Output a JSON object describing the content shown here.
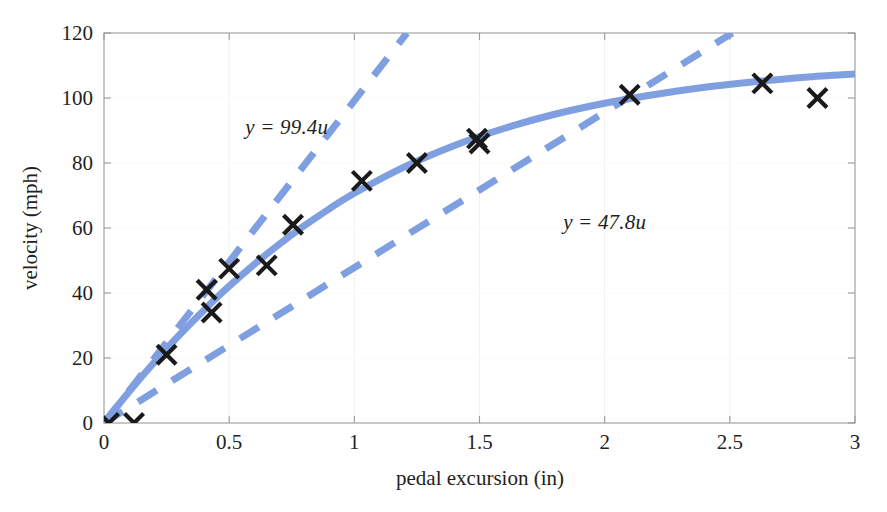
{
  "chart_data": {
    "type": "scatter",
    "title": "",
    "xlabel": "pedal excursion (in)",
    "ylabel": "velocity (mph)",
    "xlim": [
      0,
      3
    ],
    "ylim": [
      0,
      120
    ],
    "xticks": [
      "0",
      "0.5",
      "1",
      "1.5",
      "2",
      "2.5",
      "3"
    ],
    "xtick_values": [
      0,
      0.5,
      1,
      1.5,
      2,
      2.5,
      3
    ],
    "yticks": [
      "0",
      "20",
      "40",
      "60",
      "80",
      "100",
      "120"
    ],
    "ytick_values": [
      0,
      20,
      40,
      60,
      80,
      100,
      120
    ],
    "grid": "faint-vertical",
    "legend": "none",
    "marker": "x-cross-black",
    "accent_color": "#7f9fe0",
    "marker_color": "#1a1a1a",
    "axis_color": "#9a9a9a",
    "text_color": "#231f20",
    "series": [
      {
        "name": "measured data",
        "type": "scatter",
        "points": [
          [
            0.02,
            0.0
          ],
          [
            0.12,
            0.0
          ],
          [
            0.25,
            21.0
          ],
          [
            0.41,
            41.0
          ],
          [
            0.43,
            34.0
          ],
          [
            0.5,
            47.5
          ],
          [
            0.65,
            48.5
          ],
          [
            0.755,
            61.0
          ],
          [
            1.03,
            74.5
          ],
          [
            1.25,
            80.0
          ],
          [
            1.49,
            87.5
          ],
          [
            1.5,
            86.0
          ],
          [
            2.1,
            101.0
          ],
          [
            2.63,
            104.5
          ],
          [
            2.85,
            100.0
          ]
        ]
      },
      {
        "name": "fitted curve",
        "type": "line",
        "style": "solid",
        "points": [
          [
            0.0,
            0.0
          ],
          [
            0.1,
            9.6
          ],
          [
            0.2,
            18.6
          ],
          [
            0.3,
            27.0
          ],
          [
            0.4,
            34.8
          ],
          [
            0.5,
            42.1
          ],
          [
            0.6,
            48.8
          ],
          [
            0.7,
            55.0
          ],
          [
            0.8,
            60.7
          ],
          [
            0.9,
            65.9
          ],
          [
            1.0,
            70.7
          ],
          [
            1.2,
            78.8
          ],
          [
            1.4,
            85.4
          ],
          [
            1.6,
            90.7
          ],
          [
            1.8,
            95.0
          ],
          [
            2.0,
            98.4
          ],
          [
            2.2,
            101.1
          ],
          [
            2.4,
            103.3
          ],
          [
            2.6,
            105.0
          ],
          [
            2.8,
            106.4
          ],
          [
            3.0,
            107.4
          ]
        ]
      },
      {
        "name": "initial-slope tangent",
        "type": "line",
        "style": "dashed",
        "slope": 99.4,
        "points": [
          [
            0.0,
            0.0
          ],
          [
            1.21,
            120.0
          ]
        ]
      },
      {
        "name": "secant line",
        "type": "line",
        "style": "dashed",
        "slope": 47.8,
        "points": [
          [
            0.0,
            0.0
          ],
          [
            2.51,
            120.0
          ]
        ]
      }
    ],
    "annotations": [
      {
        "text": "y = 99.4u",
        "x": 0.73,
        "y": 91.0
      },
      {
        "text": "y = 47.8u",
        "x": 2.0,
        "y": 62.0
      }
    ]
  }
}
